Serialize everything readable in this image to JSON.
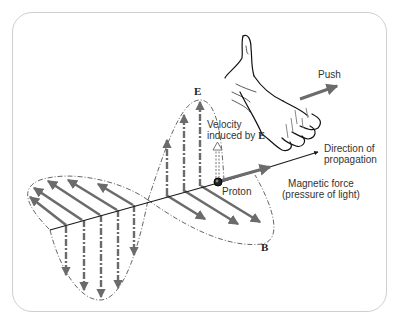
{
  "figure": {
    "labels": {
      "push": "Push",
      "e_field": "E",
      "b_field": "B",
      "velocity_line1": "Velocity",
      "velocity_line2": "induced by ",
      "velocity_E": "E",
      "direction_line1": "Direction of",
      "direction_line2": "propagation",
      "proton": "Proton",
      "magnetic_line1": "Magnetic force",
      "magnetic_line2": "(pressure of light)"
    },
    "colors": {
      "arrow_gray": "#6b6b6b",
      "line_black": "#1a1a1a",
      "frame_border": "#cfcfcf"
    }
  }
}
